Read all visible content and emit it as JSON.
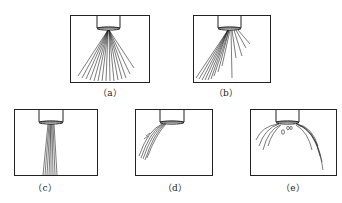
{
  "panels": [
    {
      "id": "a",
      "label": "（a）",
      "pattern": "wide symmetric fan spray"
    },
    {
      "id": "b",
      "label": "（b）",
      "pattern": "asymmetric fan spray skewed left"
    },
    {
      "id": "c",
      "label": "（c）",
      "pattern": "narrow straight jet"
    },
    {
      "id": "d",
      "label": "（d）",
      "pattern": "curved jet deflected left"
    },
    {
      "id": "e",
      "label": "（e）",
      "pattern": "umbrella spray with droplets"
    }
  ],
  "colors": {
    "line": "#222222",
    "background": "#ffffff"
  }
}
